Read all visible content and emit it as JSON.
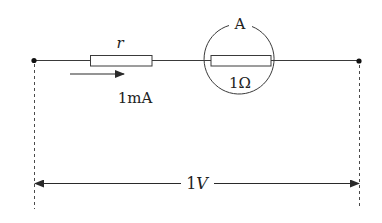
{
  "diagram": {
    "type": "circuit",
    "colors": {
      "background": "#ffffff",
      "stroke": "#3a3a3a",
      "text": "#222222"
    },
    "components": {
      "resistor_r": {
        "label": "r"
      },
      "current": {
        "label": "1mA",
        "direction": "right"
      },
      "ammeter": {
        "label": "A",
        "internal_resistor_label": "1Ω"
      },
      "voltage": {
        "label": "1V"
      }
    }
  }
}
